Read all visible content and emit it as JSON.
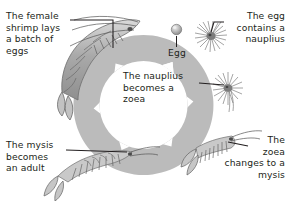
{
  "diagram": {
    "type": "cycle-diagram",
    "background_color": "#ffffff",
    "ring_color": "#b3b3b3",
    "ring_inner_color": "#ffffff",
    "arrow_gap_color": "#ffffff",
    "text_color": "#231f20",
    "direction": "clockwise"
  },
  "labels": {
    "female_shrimp": "The female\nshrimp lays\na batch of\neggs",
    "egg": "Egg",
    "egg_nauplius": "The egg\ncontains a\nnauplius",
    "nauplius_zoea": "The nauplius\nbecomes a\nzoea",
    "zoea_mysis": "The\nzoea\nchanges to a\nmysis",
    "mysis_adult": "The mysis\nbecomes\nan adult"
  },
  "stages": [
    {
      "name": "adult-female-shrimp",
      "label_key": "female_shrimp",
      "position": "top-left"
    },
    {
      "name": "egg",
      "label_key": "egg",
      "position": "top-center"
    },
    {
      "name": "nauplius",
      "label_key": "egg_nauplius",
      "position": "top-right"
    },
    {
      "name": "zoea",
      "label_key": "nauplius_zoea",
      "position": "right"
    },
    {
      "name": "mysis",
      "label_key": "zoea_mysis",
      "position": "bottom-right"
    },
    {
      "name": "juvenile-adult",
      "label_key": "mysis_adult",
      "position": "bottom-left"
    }
  ]
}
